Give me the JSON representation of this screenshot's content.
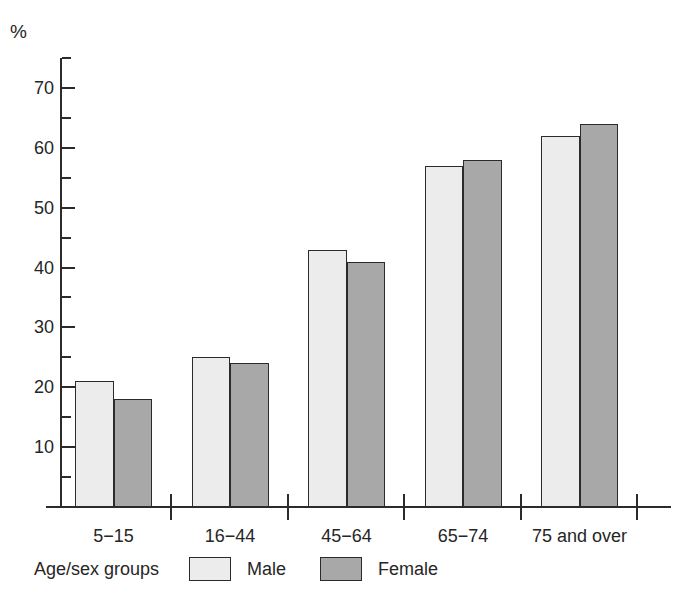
{
  "chart_data": {
    "type": "bar",
    "title": "",
    "subtitle": "",
    "xlabel": "Age/sex groups",
    "ylabel": "%",
    "categories": [
      "5−15",
      "16−44",
      "45−64",
      "65−74",
      "75 and over"
    ],
    "series": [
      {
        "name": "Male",
        "values": [
          21,
          25,
          43,
          57,
          62
        ],
        "color": "#ececec"
      },
      {
        "name": "Female",
        "values": [
          18,
          24,
          41,
          58,
          64
        ],
        "color": "#a8a8a8"
      }
    ],
    "ylim": [
      0,
      75
    ],
    "y_major_ticks": [
      10,
      20,
      30,
      40,
      50,
      60,
      70
    ],
    "y_minor_ticks": [
      5,
      15,
      25,
      35,
      45,
      55,
      65,
      75
    ],
    "y_tick_labels": [
      "10",
      "20",
      "30",
      "40",
      "50",
      "60",
      "70"
    ],
    "grid": false,
    "legend_position": "bottom"
  },
  "axes": {
    "unit_label": "%",
    "y_ticks": [
      {
        "value": 70,
        "label": "70"
      },
      {
        "value": 60,
        "label": "60"
      },
      {
        "value": 50,
        "label": "50"
      },
      {
        "value": 40,
        "label": "40"
      },
      {
        "value": 30,
        "label": "30"
      },
      {
        "value": 20,
        "label": "20"
      },
      {
        "value": 10,
        "label": "10"
      }
    ],
    "x_categories": [
      {
        "label": "5−15"
      },
      {
        "label": "16−44"
      },
      {
        "label": "45−64"
      },
      {
        "label": "65−74"
      },
      {
        "label": "75 and over"
      }
    ]
  },
  "legend": {
    "title": "Age/sex groups",
    "items": [
      {
        "label": "Male",
        "color": "#ececec"
      },
      {
        "label": "Female",
        "color": "#a8a8a8"
      }
    ]
  }
}
